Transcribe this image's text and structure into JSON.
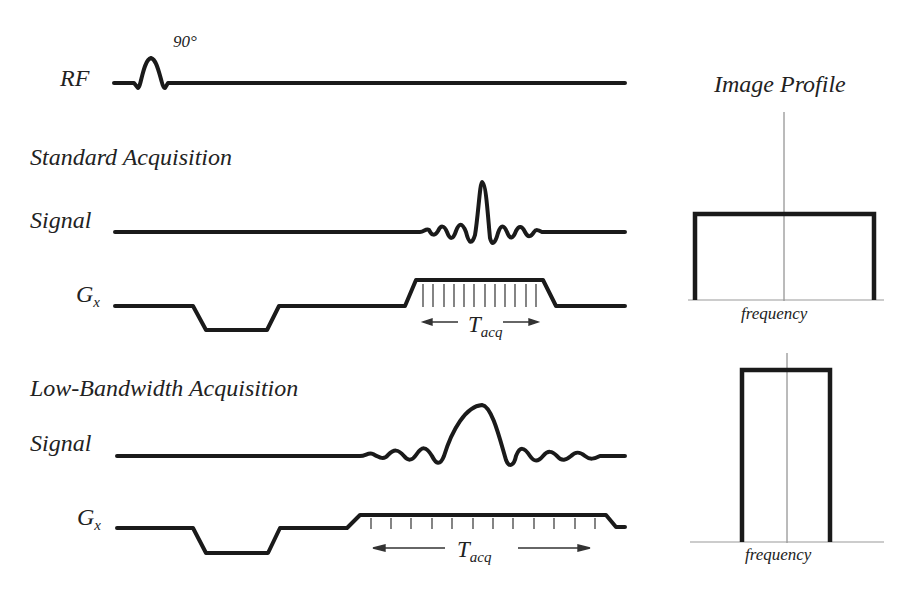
{
  "rf": {
    "label": "RF",
    "flip_angle": "90°"
  },
  "standard": {
    "title": "Standard Acquisition",
    "signal_label": "Signal",
    "gradient_label": "G",
    "gradient_sub": "x",
    "tacq_label": "T",
    "tacq_sub": "acq"
  },
  "lowbw": {
    "title": "Low-Bandwidth Acquisition",
    "signal_label": "Signal",
    "gradient_label": "G",
    "gradient_sub": "x",
    "tacq_label": "T",
    "tacq_sub": "acq"
  },
  "profile": {
    "title": "Image Profile",
    "standard_axis": "frequency",
    "lowbw_axis": "frequency"
  },
  "colors": {
    "stroke": "#1a1a1a",
    "thin": "#888888"
  }
}
